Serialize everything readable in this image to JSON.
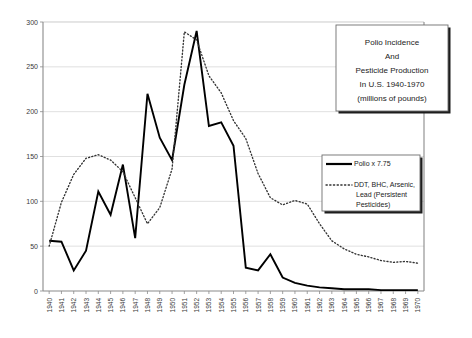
{
  "chart_data": {
    "type": "line",
    "title_lines": [
      "Polio Incidence",
      "And",
      "Pesticide Production",
      "In U.S. 1940-1970",
      "(millions of pounds)"
    ],
    "xlabel": "",
    "ylabel": "",
    "ylim": [
      0,
      300
    ],
    "yticks": [
      0,
      50,
      100,
      150,
      200,
      250,
      300
    ],
    "grid": true,
    "legend_position": "center-right",
    "x": [
      "1940",
      "1941",
      "1942",
      "1943",
      "1944",
      "1945",
      "1946",
      "1947",
      "1948",
      "1949",
      "1950",
      "1951",
      "1952",
      "1953",
      "1954",
      "1955",
      "1956",
      "1957",
      "1958",
      "1959",
      "1960",
      "1961",
      "1962",
      "1963",
      "1964",
      "1965",
      "1966",
      "1967",
      "1968",
      "1969",
      "1970"
    ],
    "series": [
      {
        "name": "Polio x 7.75",
        "style": "solid",
        "color": "#000000",
        "values": [
          56,
          55,
          23,
          45,
          111,
          85,
          141,
          59,
          220,
          171,
          146,
          230,
          290,
          184,
          188,
          162,
          26,
          23,
          41,
          15,
          9,
          6,
          4,
          3,
          2,
          2,
          2,
          1,
          1,
          1,
          1
        ]
      },
      {
        "name": "DDT, BHC, Arsenic, Lead (Persistent Pesticides)",
        "style": "dotted",
        "color": "#333333",
        "values": [
          50,
          99,
          130,
          148,
          152,
          146,
          133,
          104,
          75,
          93,
          136,
          289,
          280,
          240,
          221,
          190,
          170,
          131,
          104,
          96,
          101,
          97,
          75,
          56,
          47,
          41,
          38,
          34,
          32,
          33,
          31
        ]
      }
    ],
    "legend": [
      {
        "label": "Polio x 7.75",
        "style": "solid"
      },
      {
        "label": "DDT, BHC, Arsenic,",
        "style": "dotted"
      },
      {
        "label": "Lead (Persistent",
        "style": "none"
      },
      {
        "label": "Pesticides)",
        "style": "none"
      }
    ]
  }
}
